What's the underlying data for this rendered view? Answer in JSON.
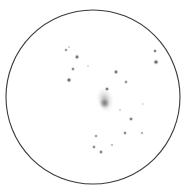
{
  "canvas": {
    "width": 188,
    "height": 195,
    "background_color": "#ffffff",
    "title": "Telescope eyepiece sketch of a galaxy and field stars"
  },
  "field_of_view": {
    "shape": "circle",
    "center_x": 93,
    "center_y": 97,
    "radius": 87,
    "stroke_color": "#3a3a3a",
    "stroke_width": 1.1,
    "fill_color": "#ffffff",
    "label": "eyepiece-field-circle"
  },
  "deep_sky_object": {
    "name": "galaxy-smudge",
    "type": "diffuse nebulous patch",
    "center_x": 105,
    "center_y": 100,
    "width": 19,
    "height": 28,
    "rotation_deg": -12,
    "core_color": "#8e8e8e",
    "halo_color": "#d6d6d6",
    "core_x": 104,
    "core_y": 103,
    "core_radius": 6,
    "core_intensity": 0.55
  },
  "stars": [
    {
      "x": 66,
      "y": 50,
      "r": 1.1,
      "opacity": 0.6,
      "name": "star-1"
    },
    {
      "x": 69,
      "y": 47,
      "r": 0.7,
      "opacity": 0.4,
      "name": "star-2"
    },
    {
      "x": 77,
      "y": 57,
      "r": 1.4,
      "opacity": 0.75,
      "name": "star-3"
    },
    {
      "x": 73,
      "y": 69,
      "r": 1.2,
      "opacity": 0.6,
      "name": "star-4"
    },
    {
      "x": 69,
      "y": 80,
      "r": 1.5,
      "opacity": 0.8,
      "name": "star-5"
    },
    {
      "x": 155,
      "y": 51,
      "r": 1.2,
      "opacity": 0.65,
      "name": "star-6"
    },
    {
      "x": 156,
      "y": 62,
      "r": 1.6,
      "opacity": 0.8,
      "name": "star-7"
    },
    {
      "x": 116,
      "y": 72,
      "r": 1.4,
      "opacity": 0.7,
      "name": "star-8"
    },
    {
      "x": 107,
      "y": 89,
      "r": 1.3,
      "opacity": 0.7,
      "name": "star-9"
    },
    {
      "x": 126,
      "y": 82,
      "r": 1.2,
      "opacity": 0.55,
      "name": "star-10"
    },
    {
      "x": 131,
      "y": 119,
      "r": 1.3,
      "opacity": 0.65,
      "name": "star-11"
    },
    {
      "x": 125,
      "y": 133,
      "r": 1.2,
      "opacity": 0.6,
      "name": "star-12"
    },
    {
      "x": 142,
      "y": 133,
      "r": 1.0,
      "opacity": 0.45,
      "name": "star-13"
    },
    {
      "x": 96,
      "y": 136,
      "r": 1.1,
      "opacity": 0.55,
      "name": "star-14"
    },
    {
      "x": 94,
      "y": 147,
      "r": 1.2,
      "opacity": 0.6,
      "name": "star-15"
    },
    {
      "x": 101,
      "y": 152,
      "r": 1.3,
      "opacity": 0.65,
      "name": "star-16"
    },
    {
      "x": 112,
      "y": 145,
      "r": 0.9,
      "opacity": 0.4,
      "name": "star-17"
    },
    {
      "x": 120,
      "y": 110,
      "r": 0.8,
      "opacity": 0.35,
      "name": "star-18"
    },
    {
      "x": 88,
      "y": 66,
      "r": 0.7,
      "opacity": 0.3,
      "name": "star-19"
    },
    {
      "x": 143,
      "y": 104,
      "r": 0.7,
      "opacity": 0.3,
      "name": "star-20"
    }
  ],
  "star_color": "#555555"
}
